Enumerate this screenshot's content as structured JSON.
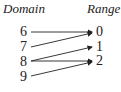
{
  "headers": {
    "domain": "Domain",
    "range": "Range"
  },
  "domain": [
    "6",
    "7",
    "8",
    "9"
  ],
  "range": [
    "0",
    "1",
    "2"
  ],
  "mappings": [
    [
      "6",
      "0"
    ],
    [
      "7",
      "0"
    ],
    [
      "8",
      "1"
    ],
    [
      "8",
      "2"
    ],
    [
      "9",
      "2"
    ]
  ]
}
